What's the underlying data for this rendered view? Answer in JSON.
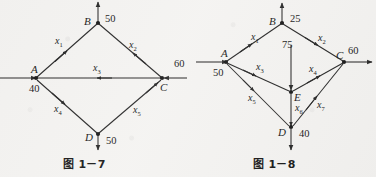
{
  "figures": [
    {
      "id": "fig-1-7",
      "caption": "图 1－7",
      "nodes": [
        {
          "name": "B",
          "label": "B",
          "x": 98,
          "y": 22
        },
        {
          "name": "A",
          "label": "A",
          "x": 35,
          "y": 78
        },
        {
          "name": "C",
          "label": "C",
          "x": 162,
          "y": 78
        },
        {
          "name": "D",
          "label": "D",
          "x": 98,
          "y": 133
        }
      ],
      "external_flows": [
        {
          "name": "B-out",
          "value": "50",
          "at": "B",
          "direction": "up"
        },
        {
          "name": "A-in",
          "value": "40",
          "at": "A",
          "direction": "right"
        },
        {
          "name": "C-in",
          "value": "60",
          "at": "C",
          "direction": "left"
        },
        {
          "name": "D-out",
          "value": "50",
          "at": "D",
          "direction": "down"
        }
      ],
      "edges": [
        {
          "name": "x1",
          "label": "x",
          "sub": "1",
          "from": "A",
          "to": "B"
        },
        {
          "name": "x2",
          "label": "x",
          "sub": "2",
          "from": "C",
          "to": "B"
        },
        {
          "name": "x3",
          "label": "x",
          "sub": "3",
          "from": "C",
          "to": "A"
        },
        {
          "name": "x4",
          "label": "x",
          "sub": "4",
          "from": "A",
          "to": "D"
        },
        {
          "name": "x5",
          "label": "x",
          "sub": "5",
          "from": "D",
          "to": "C"
        }
      ]
    },
    {
      "id": "fig-1-8",
      "caption": "图 1－8",
      "nodes": [
        {
          "name": "B",
          "label": "B",
          "x": 282,
          "y": 22
        },
        {
          "name": "A",
          "label": "A",
          "x": 226,
          "y": 62
        },
        {
          "name": "C",
          "label": "C",
          "x": 344,
          "y": 62
        },
        {
          "name": "E",
          "label": "E",
          "x": 291,
          "y": 92
        },
        {
          "name": "D",
          "label": "D",
          "x": 291,
          "y": 127
        }
      ],
      "external_flows": [
        {
          "name": "B-out",
          "value": "25",
          "at": "B",
          "direction": "up"
        },
        {
          "name": "A-in",
          "value": "50",
          "at": "A",
          "direction": "right"
        },
        {
          "name": "C-out",
          "value": "60",
          "at": "C",
          "direction": "right"
        },
        {
          "name": "E-in",
          "value": "75",
          "at": "E",
          "direction": "down"
        },
        {
          "name": "D-out",
          "value": "40",
          "at": "D",
          "direction": "down"
        }
      ],
      "edges": [
        {
          "name": "x1",
          "label": "x",
          "sub": "1",
          "from": "A",
          "to": "B"
        },
        {
          "name": "x2",
          "label": "x",
          "sub": "2",
          "from": "B",
          "to": "C"
        },
        {
          "name": "x3",
          "label": "x",
          "sub": "3",
          "from": "A",
          "to": "E"
        },
        {
          "name": "x4",
          "label": "x",
          "sub": "4",
          "from": "E",
          "to": "C"
        },
        {
          "name": "x5",
          "label": "x",
          "sub": "5",
          "from": "A",
          "to": "D"
        },
        {
          "name": "x6",
          "label": "x",
          "sub": "6",
          "from": "E",
          "to": "D"
        },
        {
          "name": "x7",
          "label": "x",
          "sub": "7",
          "from": "D",
          "to": "C"
        }
      ]
    }
  ],
  "labels": {
    "f7_B": "B",
    "f7_A": "A",
    "f7_C": "C",
    "f7_D": "D",
    "f7_Bnum": "50",
    "f7_Anum": "40",
    "f7_Cnum": "60",
    "f7_Dnum": "50",
    "f7_x1": "x",
    "f7_x1s": "1",
    "f7_x2": "x",
    "f7_x2s": "2",
    "f7_x3": "x",
    "f7_x3s": "3",
    "f7_x4": "x",
    "f7_x4s": "4",
    "f7_x5": "x",
    "f7_x5s": "5",
    "f7_caption": "图 1－7",
    "f8_B": "B",
    "f8_A": "A",
    "f8_C": "C",
    "f8_D": "D",
    "f8_E": "E",
    "f8_Bnum": "25",
    "f8_Anum": "50",
    "f8_Cnum": "60",
    "f8_Dnum": "40",
    "f8_Enum": "75",
    "f8_x1": "x",
    "f8_x1s": "1",
    "f8_x2": "x",
    "f8_x2s": "2",
    "f8_x3": "x",
    "f8_x3s": "3",
    "f8_x4": "x",
    "f8_x4s": "4",
    "f8_x5": "x",
    "f8_x5s": "5",
    "f8_x6": "x",
    "f8_x6s": "6",
    "f8_x7": "x",
    "f8_x7s": "7",
    "f8_caption": "图 1－8"
  },
  "colors": {
    "ink": "#1b1b1b",
    "line": "#2a2a2a",
    "paper": "#f4f3f1"
  }
}
